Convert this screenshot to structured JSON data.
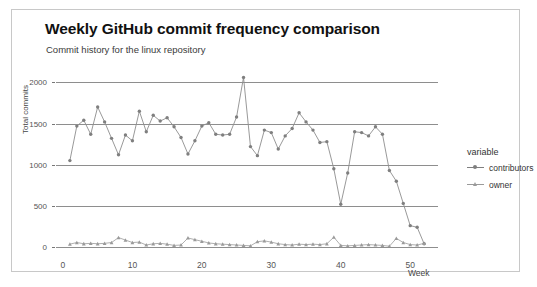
{
  "chart_data": {
    "type": "line",
    "title": "Weekly GitHub commit frequency comparison",
    "subtitle": "Commit history for the linux repository",
    "xlabel": "Week",
    "ylabel": "Total commits",
    "legend_title": "variable",
    "legend_position": "right",
    "grid": true,
    "xlim": [
      -1,
      54
    ],
    "ylim": [
      -60,
      2150
    ],
    "xticks": [
      0,
      10,
      20,
      30,
      40,
      50
    ],
    "yticks": [
      0,
      500,
      1000,
      1500,
      2000
    ],
    "x": [
      1,
      2,
      3,
      4,
      5,
      6,
      7,
      8,
      9,
      10,
      11,
      12,
      13,
      14,
      15,
      16,
      17,
      18,
      19,
      20,
      21,
      22,
      23,
      24,
      25,
      26,
      27,
      28,
      29,
      30,
      31,
      32,
      33,
      34,
      35,
      36,
      37,
      38,
      39,
      40,
      41,
      42,
      43,
      44,
      45,
      46,
      47,
      48,
      49,
      50,
      51,
      52
    ],
    "series": [
      {
        "name": "contributors",
        "color": "#7f7f7f",
        "marker": "circle",
        "values": [
          1050,
          1470,
          1540,
          1370,
          1700,
          1520,
          1320,
          1120,
          1360,
          1290,
          1650,
          1400,
          1600,
          1530,
          1570,
          1460,
          1330,
          1130,
          1290,
          1470,
          1510,
          1370,
          1360,
          1370,
          1580,
          2060,
          1220,
          1110,
          1420,
          1390,
          1190,
          1350,
          1440,
          1630,
          1520,
          1420,
          1270,
          1280,
          950,
          520,
          900,
          1400,
          1390,
          1350,
          1460,
          1370,
          930,
          800,
          530,
          260,
          240,
          40
        ]
      },
      {
        "name": "owner",
        "color": "#9a9a9a",
        "marker": "triangle",
        "values": [
          35,
          55,
          40,
          45,
          40,
          45,
          55,
          115,
          85,
          55,
          60,
          25,
          40,
          45,
          35,
          20,
          25,
          110,
          90,
          70,
          50,
          40,
          35,
          30,
          25,
          20,
          15,
          65,
          75,
          60,
          40,
          30,
          25,
          35,
          30,
          35,
          30,
          40,
          120,
          20,
          15,
          20,
          25,
          30,
          25,
          20,
          10,
          105,
          55,
          30,
          25,
          45
        ]
      }
    ]
  }
}
